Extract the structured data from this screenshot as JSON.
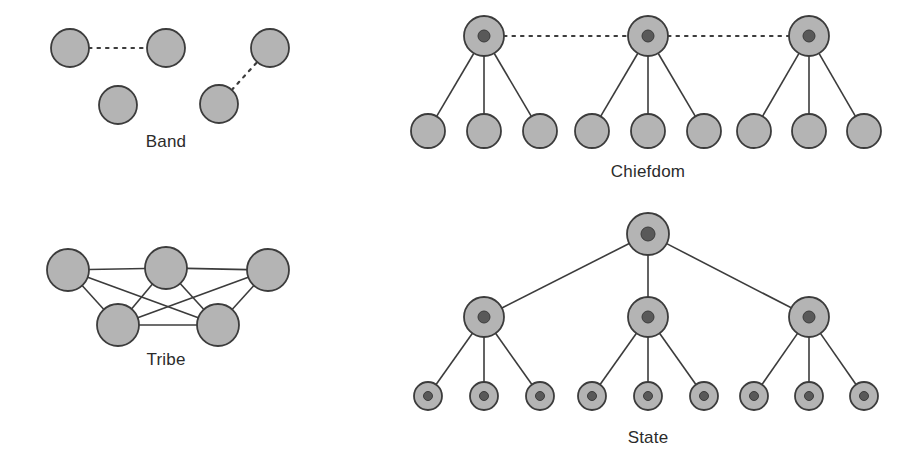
{
  "figure": {
    "background_color": "#ffffff",
    "node_fill": "#b4b4b4",
    "node_stroke": "#3c3c3c",
    "node_core_fill": "#595959",
    "edge_color": "#3c3c3c",
    "label_color": "#2b2b2b"
  },
  "panels": [
    {
      "id": "band",
      "label": "Band",
      "label_x": 166,
      "label_y": 147,
      "description": "Four equal circles, two loose dotted pair links, no hierarchy",
      "nodes": [
        {
          "name": "band-node-1",
          "x": 70,
          "y": 48,
          "r": 19,
          "core": false
        },
        {
          "name": "band-node-2",
          "x": 166,
          "y": 48,
          "r": 19,
          "core": false
        },
        {
          "name": "band-node-3",
          "x": 270,
          "y": 48,
          "r": 19,
          "core": false
        },
        {
          "name": "band-node-4",
          "x": 118,
          "y": 105,
          "r": 19,
          "core": false
        },
        {
          "name": "band-node-5",
          "x": 219,
          "y": 104,
          "r": 19,
          "core": false
        }
      ],
      "edges": [
        {
          "from": 0,
          "to": 1,
          "style": "dotted"
        },
        {
          "from": 4,
          "to": 2,
          "style": "dotted"
        }
      ]
    },
    {
      "id": "tribe",
      "label": "Tribe",
      "label_x": 166,
      "label_y": 365,
      "description": "Five circles densely interlinked by solid lines, egalitarian network",
      "nodes": [
        {
          "name": "tribe-node-1",
          "x": 68,
          "y": 270,
          "r": 21,
          "core": false
        },
        {
          "name": "tribe-node-2",
          "x": 166,
          "y": 268,
          "r": 21,
          "core": false
        },
        {
          "name": "tribe-node-3",
          "x": 268,
          "y": 270,
          "r": 21,
          "core": false
        },
        {
          "name": "tribe-node-4",
          "x": 118,
          "y": 325,
          "r": 21,
          "core": false
        },
        {
          "name": "tribe-node-5",
          "x": 218,
          "y": 325,
          "r": 21,
          "core": false
        }
      ],
      "edges": [
        {
          "from": 0,
          "to": 1,
          "style": "solid"
        },
        {
          "from": 1,
          "to": 2,
          "style": "solid"
        },
        {
          "from": 0,
          "to": 3,
          "style": "solid"
        },
        {
          "from": 0,
          "to": 4,
          "style": "solid"
        },
        {
          "from": 1,
          "to": 3,
          "style": "solid"
        },
        {
          "from": 1,
          "to": 4,
          "style": "solid"
        },
        {
          "from": 2,
          "to": 3,
          "style": "solid"
        },
        {
          "from": 2,
          "to": 4,
          "style": "solid"
        },
        {
          "from": 3,
          "to": 4,
          "style": "solid"
        }
      ]
    },
    {
      "id": "chiefdom",
      "label": "Chiefdom",
      "label_x": 648,
      "label_y": 177,
      "description": "Three chiefs with dark centers linked by dotted lines, each leading three followers",
      "nodes": [
        {
          "name": "chiefdom-chief-1",
          "x": 484,
          "y": 36,
          "r": 20,
          "core": true,
          "core_r": 6
        },
        {
          "name": "chiefdom-chief-2",
          "x": 648,
          "y": 36,
          "r": 20,
          "core": true,
          "core_r": 6
        },
        {
          "name": "chiefdom-chief-3",
          "x": 809,
          "y": 36,
          "r": 20,
          "core": true,
          "core_r": 6
        },
        {
          "name": "chiefdom-follower-1",
          "x": 428,
          "y": 131,
          "r": 17,
          "core": false
        },
        {
          "name": "chiefdom-follower-2",
          "x": 484,
          "y": 131,
          "r": 17,
          "core": false
        },
        {
          "name": "chiefdom-follower-3",
          "x": 540,
          "y": 131,
          "r": 17,
          "core": false
        },
        {
          "name": "chiefdom-follower-4",
          "x": 592,
          "y": 131,
          "r": 17,
          "core": false
        },
        {
          "name": "chiefdom-follower-5",
          "x": 648,
          "y": 131,
          "r": 17,
          "core": false
        },
        {
          "name": "chiefdom-follower-6",
          "x": 704,
          "y": 131,
          "r": 17,
          "core": false
        },
        {
          "name": "chiefdom-follower-7",
          "x": 754,
          "y": 131,
          "r": 17,
          "core": false
        },
        {
          "name": "chiefdom-follower-8",
          "x": 809,
          "y": 131,
          "r": 17,
          "core": false
        },
        {
          "name": "chiefdom-follower-9",
          "x": 864,
          "y": 131,
          "r": 17,
          "core": false
        }
      ],
      "edges": [
        {
          "from": 0,
          "to": 1,
          "style": "dotted"
        },
        {
          "from": 1,
          "to": 2,
          "style": "dotted"
        },
        {
          "from": 0,
          "to": 3,
          "style": "solid"
        },
        {
          "from": 0,
          "to": 4,
          "style": "solid"
        },
        {
          "from": 0,
          "to": 5,
          "style": "solid"
        },
        {
          "from": 1,
          "to": 6,
          "style": "solid"
        },
        {
          "from": 1,
          "to": 7,
          "style": "solid"
        },
        {
          "from": 1,
          "to": 8,
          "style": "solid"
        },
        {
          "from": 2,
          "to": 9,
          "style": "solid"
        },
        {
          "from": 2,
          "to": 10,
          "style": "solid"
        },
        {
          "from": 2,
          "to": 11,
          "style": "solid"
        }
      ]
    },
    {
      "id": "state",
      "label": "State",
      "label_x": 648,
      "label_y": 443,
      "description": "Three-tier hierarchy: one ruler, three regional officials, nine local units, all with dark centers",
      "nodes": [
        {
          "name": "state-ruler",
          "x": 648,
          "y": 234,
          "r": 21,
          "core": true,
          "core_r": 7
        },
        {
          "name": "state-official-1",
          "x": 484,
          "y": 317,
          "r": 20,
          "core": true,
          "core_r": 6
        },
        {
          "name": "state-official-2",
          "x": 648,
          "y": 317,
          "r": 20,
          "core": true,
          "core_r": 6
        },
        {
          "name": "state-official-3",
          "x": 809,
          "y": 317,
          "r": 20,
          "core": true,
          "core_r": 6
        },
        {
          "name": "state-unit-1",
          "x": 428,
          "y": 396,
          "r": 14,
          "core": true,
          "core_r": 4.5
        },
        {
          "name": "state-unit-2",
          "x": 484,
          "y": 396,
          "r": 14,
          "core": true,
          "core_r": 4.5
        },
        {
          "name": "state-unit-3",
          "x": 540,
          "y": 396,
          "r": 14,
          "core": true,
          "core_r": 4.5
        },
        {
          "name": "state-unit-4",
          "x": 592,
          "y": 396,
          "r": 14,
          "core": true,
          "core_r": 4.5
        },
        {
          "name": "state-unit-5",
          "x": 648,
          "y": 396,
          "r": 14,
          "core": true,
          "core_r": 4.5
        },
        {
          "name": "state-unit-6",
          "x": 704,
          "y": 396,
          "r": 14,
          "core": true,
          "core_r": 4.5
        },
        {
          "name": "state-unit-7",
          "x": 754,
          "y": 396,
          "r": 14,
          "core": true,
          "core_r": 4.5
        },
        {
          "name": "state-unit-8",
          "x": 809,
          "y": 396,
          "r": 14,
          "core": true,
          "core_r": 4.5
        },
        {
          "name": "state-unit-9",
          "x": 864,
          "y": 396,
          "r": 14,
          "core": true,
          "core_r": 4.5
        }
      ],
      "edges": [
        {
          "from": 0,
          "to": 1,
          "style": "solid"
        },
        {
          "from": 0,
          "to": 2,
          "style": "solid"
        },
        {
          "from": 0,
          "to": 3,
          "style": "solid"
        },
        {
          "from": 1,
          "to": 4,
          "style": "solid"
        },
        {
          "from": 1,
          "to": 5,
          "style": "solid"
        },
        {
          "from": 1,
          "to": 6,
          "style": "solid"
        },
        {
          "from": 2,
          "to": 7,
          "style": "solid"
        },
        {
          "from": 2,
          "to": 8,
          "style": "solid"
        },
        {
          "from": 2,
          "to": 9,
          "style": "solid"
        },
        {
          "from": 3,
          "to": 10,
          "style": "solid"
        },
        {
          "from": 3,
          "to": 11,
          "style": "solid"
        },
        {
          "from": 3,
          "to": 12,
          "style": "solid"
        }
      ]
    }
  ]
}
